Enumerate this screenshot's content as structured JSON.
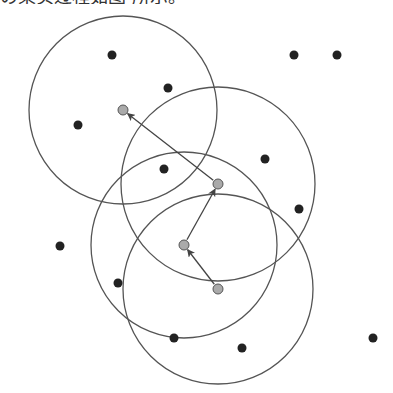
{
  "caption": "の果实过程如图 所示。",
  "colors": {
    "circle_stroke": "#555555",
    "point_fill": "#222222",
    "center_fill": "#aaaaaa",
    "center_stroke": "#555555",
    "arrow": "#444444"
  },
  "circles": [
    {
      "cx": 123,
      "cy": 110,
      "r": 94
    },
    {
      "cx": 218,
      "cy": 184,
      "r": 97
    },
    {
      "cx": 184,
      "cy": 245,
      "r": 93
    },
    {
      "cx": 218,
      "cy": 289,
      "r": 95
    }
  ],
  "centers": [
    {
      "x": 123,
      "y": 110
    },
    {
      "x": 218,
      "y": 184
    },
    {
      "x": 184,
      "y": 245
    },
    {
      "x": 218,
      "y": 289
    }
  ],
  "arrows": [
    {
      "from": [
        218,
        289
      ],
      "to": [
        184,
        245
      ]
    },
    {
      "from": [
        184,
        245
      ],
      "to": [
        218,
        184
      ]
    },
    {
      "from": [
        218,
        184
      ],
      "to": [
        123,
        110
      ]
    }
  ],
  "points": [
    {
      "x": 112,
      "y": 55
    },
    {
      "x": 168,
      "y": 88
    },
    {
      "x": 78,
      "y": 125
    },
    {
      "x": 164,
      "y": 169
    },
    {
      "x": 294,
      "y": 55
    },
    {
      "x": 337,
      "y": 55
    },
    {
      "x": 265,
      "y": 159
    },
    {
      "x": 299,
      "y": 209
    },
    {
      "x": 60,
      "y": 246
    },
    {
      "x": 118,
      "y": 283
    },
    {
      "x": 174,
      "y": 338
    },
    {
      "x": 242,
      "y": 348
    },
    {
      "x": 373,
      "y": 338
    }
  ]
}
